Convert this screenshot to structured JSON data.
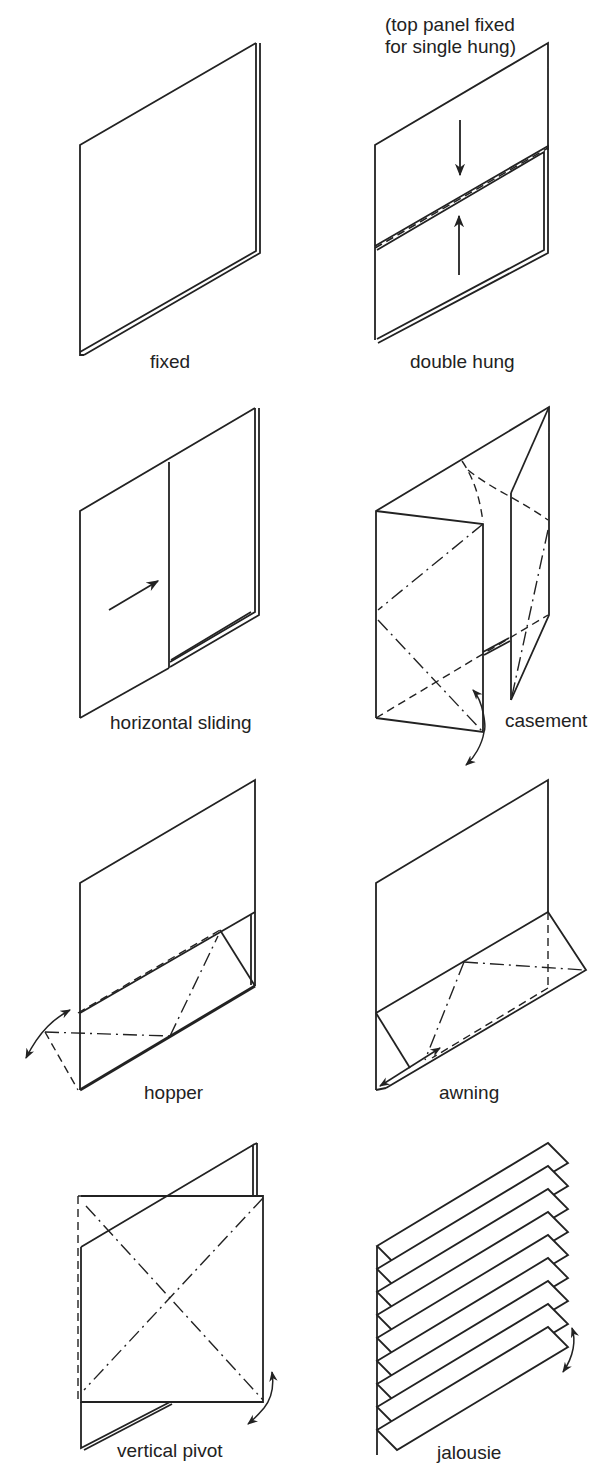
{
  "figure": {
    "ink_color": "#222222",
    "background": "#ffffff"
  },
  "note": {
    "line1": "(top panel fixed",
    "line2": "for single hung)"
  },
  "panels": [
    {
      "id": "fixed",
      "label": "fixed"
    },
    {
      "id": "double-hung",
      "label": "double hung"
    },
    {
      "id": "horizontal-sliding",
      "label": "horizontal sliding"
    },
    {
      "id": "casement",
      "label": "casement"
    },
    {
      "id": "hopper",
      "label": "hopper"
    },
    {
      "id": "awning",
      "label": "awning"
    },
    {
      "id": "vertical-pivot",
      "label": "vertical pivot"
    },
    {
      "id": "jalousie",
      "label": "jalousie"
    }
  ]
}
